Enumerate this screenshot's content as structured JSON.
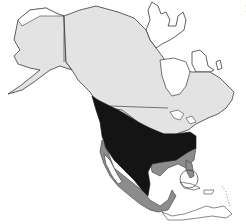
{
  "map": {
    "title": "",
    "region": "North America",
    "colors": {
      "ocean": "#ffffff",
      "outside_range": "#e3e3e3",
      "core_range": "#141414",
      "secondary_range": "#8c8c8c",
      "outline": "#3a3a3a"
    },
    "areas": [
      {
        "id": "alaska",
        "shade": "outside_range"
      },
      {
        "id": "canada",
        "shade": "outside_range"
      },
      {
        "id": "united-states-north-west",
        "shade": "core_range"
      },
      {
        "id": "united-states-central",
        "shade": "core_range"
      },
      {
        "id": "mexico-interior",
        "shade": "core_range"
      },
      {
        "id": "gulf-coast-and-southeast",
        "shade": "secondary_range"
      },
      {
        "id": "mexico-coasts",
        "shade": "secondary_range"
      },
      {
        "id": "central-america",
        "shade": "secondary_range"
      },
      {
        "id": "greenland-and-arctic-islands",
        "shade": "ocean"
      },
      {
        "id": "caribbean-islands",
        "shade": "ocean"
      }
    ]
  },
  "edge_text": {
    "line1": "I",
    "line2": "l"
  }
}
